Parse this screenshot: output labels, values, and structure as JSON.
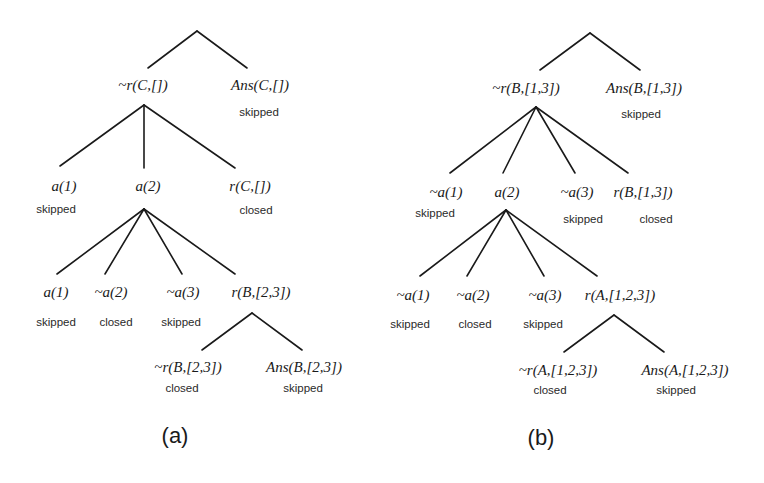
{
  "trees": {
    "a": {
      "caption": "(a)",
      "root_children": {
        "neg": {
          "term": "~r(C,[])"
        },
        "ans": {
          "term": "Ans(C,[])",
          "status": "skipped"
        }
      },
      "level2": [
        {
          "term": "a(1)",
          "status": "skipped"
        },
        {
          "term": "a(2)"
        },
        {
          "term": "r(C,[])",
          "status": "closed"
        }
      ],
      "level3": [
        {
          "term": "a(1)",
          "status": "skipped"
        },
        {
          "term": "~a(2)",
          "status": "closed"
        },
        {
          "term": "~a(3)",
          "status": "skipped"
        },
        {
          "term": "r(B,[2,3])"
        }
      ],
      "level4": [
        {
          "term": "~r(B,[2,3])",
          "status": "closed"
        },
        {
          "term": "Ans(B,[2,3])",
          "status": "skipped"
        }
      ]
    },
    "b": {
      "caption": "(b)",
      "root_children": {
        "neg": {
          "term": "~r(B,[1,3])"
        },
        "ans": {
          "term": "Ans(B,[1,3])",
          "status": "skipped"
        }
      },
      "level2": [
        {
          "term": "~a(1)",
          "status": "skipped"
        },
        {
          "term": "a(2)"
        },
        {
          "term": "~a(3)",
          "status": "skipped"
        },
        {
          "term": "r(B,[1,3])",
          "status": "closed"
        }
      ],
      "level3": [
        {
          "term": "~a(1)",
          "status": "skipped"
        },
        {
          "term": "~a(2)",
          "status": "closed"
        },
        {
          "term": "~a(3)",
          "status": "skipped"
        },
        {
          "term": "r(A,[1,2,3])"
        }
      ],
      "level4": [
        {
          "term": "~r(A,[1,2,3])",
          "status": "closed"
        },
        {
          "term": "Ans(A,[1,2,3])",
          "status": "skipped"
        }
      ]
    }
  },
  "colors": {
    "line": "#1a1a1a",
    "text": "#1a1a1a",
    "background": "#ffffff"
  }
}
